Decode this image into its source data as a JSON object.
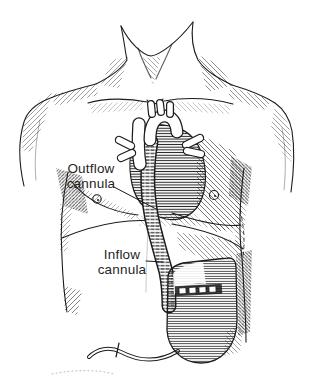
{
  "figure": {
    "labels": {
      "outflow": {
        "line1": "Outflow",
        "line2": "cannula"
      },
      "inflow": {
        "line1": "Inflow",
        "line2": "cannula"
      }
    },
    "colors": {
      "ink": "#1c1c1c",
      "paper": "#ffffff"
    }
  }
}
